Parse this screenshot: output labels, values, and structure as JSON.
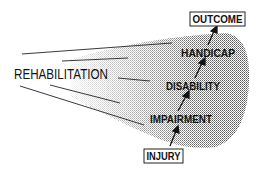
{
  "diagram": {
    "title_label": "REHABILITATION",
    "stages": [
      {
        "id": "injury",
        "label": "INJURY",
        "boxed": true
      },
      {
        "id": "impairment",
        "label": "IMPAIRMENT",
        "boxed": false
      },
      {
        "id": "disability",
        "label": "DISABILITY",
        "boxed": false
      },
      {
        "id": "handicap",
        "label": "HANDICAP",
        "boxed": false
      },
      {
        "id": "outcome",
        "label": "OUTCOME",
        "boxed": true
      }
    ],
    "flow": [
      "INJURY",
      "IMPAIRMENT",
      "DISABILITY",
      "HANDICAP",
      "OUTCOME"
    ],
    "colors": {
      "ink": "#111111",
      "shade": "#9a9a9a",
      "background": "#ffffff"
    }
  }
}
